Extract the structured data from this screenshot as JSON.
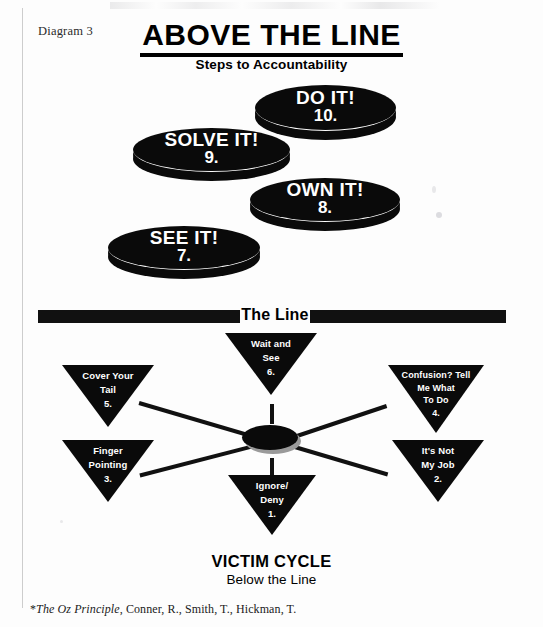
{
  "page": {
    "diagram_label": "Diagram 3",
    "title": "ABOVE THE LINE",
    "subtitle": "Steps to Accountability",
    "line_label": "The Line",
    "victim_cycle_title": "VICTIM CYCLE",
    "below_the_line": "Below the Line"
  },
  "above_the_line": {
    "steps": [
      {
        "label": "DO IT!",
        "number": "10."
      },
      {
        "label": "SOLVE IT!",
        "number": "9."
      },
      {
        "label": "OWN IT!",
        "number": "8."
      },
      {
        "label": "SEE IT!",
        "number": "7."
      }
    ]
  },
  "victim_cycle": {
    "nodes": [
      {
        "line1": "Wait and",
        "line2": "See",
        "line3": "",
        "number": "6."
      },
      {
        "line1": "Cover Your",
        "line2": "Tail",
        "line3": "",
        "number": "5."
      },
      {
        "line1": "Confusion? Tell",
        "line2": "Me What",
        "line3": "To Do",
        "number": "4."
      },
      {
        "line1": "Finger",
        "line2": "Pointing",
        "line3": "",
        "number": "3."
      },
      {
        "line1": "It's Not",
        "line2": "My Job",
        "line3": "",
        "number": "2."
      },
      {
        "line1": "Ignore/",
        "line2": "Deny",
        "line3": "",
        "number": "1."
      }
    ]
  },
  "footer": {
    "citation_prefix": "*",
    "citation_italic": "The Oz Principle",
    "citation_rest": ", Conner, R., Smith, T., Hickman, T."
  },
  "colors": {
    "ink": "#0a0a0a",
    "paper": "#fdfdfd",
    "hub_shadow": "#9a9a9a"
  }
}
